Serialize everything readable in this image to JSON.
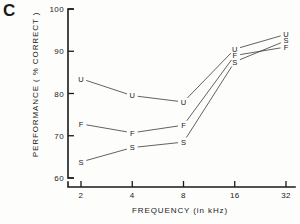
{
  "panel": {
    "label": "C"
  },
  "axes": {
    "y_title": "PERFORMANCE ( % CORRECT )",
    "x_title": "FREQUENCY (in kHz)",
    "y_ticks": [
      "100",
      "90",
      "80",
      "70",
      "60"
    ],
    "x_ticks": [
      "2",
      "4",
      "8",
      "16",
      "32"
    ]
  },
  "chart_data": {
    "type": "line",
    "title": "C",
    "xlabel": "FREQUENCY (in kHz)",
    "ylabel": "PERFORMANCE ( % CORRECT )",
    "x": [
      2,
      4,
      8,
      16,
      32
    ],
    "x_scale": "log2",
    "xlim": [
      2,
      32
    ],
    "ylim": [
      60,
      100
    ],
    "y_ticks": [
      60,
      70,
      80,
      90,
      100
    ],
    "x_ticks": [
      2,
      4,
      8,
      16,
      32
    ],
    "grid": false,
    "legend": "none",
    "marker_style": "letter-label",
    "series": [
      {
        "name": "U",
        "label": "U",
        "values": [
          83.5,
          79.5,
          78.0,
          90.5,
          94.0
        ]
      },
      {
        "name": "F",
        "label": "F",
        "values": [
          72.8,
          70.7,
          72.5,
          89.0,
          91.0
        ]
      },
      {
        "name": "S",
        "label": "S",
        "values": [
          63.8,
          67.2,
          68.5,
          87.5,
          92.5
        ]
      }
    ]
  }
}
